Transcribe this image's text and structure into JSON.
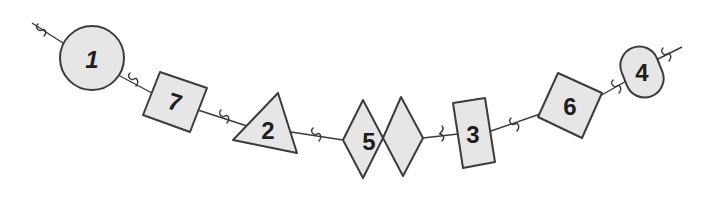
{
  "diagram": {
    "colors": {
      "background": "#ffffff",
      "shape_fill": "#e6e6e6",
      "outline": "#3c3c3c",
      "text": "#1e1e1e"
    },
    "string": {
      "start": [
        32,
        23
      ],
      "end": [
        682,
        47
      ]
    },
    "shapes": [
      {
        "order": 1,
        "type": "circle",
        "label": "1"
      },
      {
        "order": 2,
        "type": "square",
        "label": "7"
      },
      {
        "order": 3,
        "type": "triangle",
        "label": "2"
      },
      {
        "order": 4,
        "type": "double-diamond",
        "label": "5"
      },
      {
        "order": 5,
        "type": "rectangle",
        "label": "3"
      },
      {
        "order": 6,
        "type": "square",
        "label": "6"
      },
      {
        "order": 7,
        "type": "pill",
        "label": "4"
      }
    ],
    "connectors": [
      {
        "position": [
          41,
          30
        ]
      },
      {
        "position": [
          132,
          80
        ]
      },
      {
        "position": [
          223,
          117
        ]
      },
      {
        "position": [
          315,
          135
        ]
      },
      {
        "position": [
          440,
          133
        ]
      },
      {
        "position": [
          513,
          125
        ]
      },
      {
        "position": [
          615,
          87
        ]
      },
      {
        "position": [
          665,
          55
        ]
      }
    ]
  }
}
